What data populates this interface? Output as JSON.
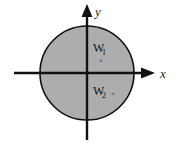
{
  "figure": {
    "type": "coordinate-plane-diagram",
    "background_color": "#ffffff",
    "axes": {
      "x_label": "x",
      "y_label": "y",
      "axis_color": "#111111",
      "origin": {
        "x": 87,
        "y": 73
      }
    },
    "shapes": [
      {
        "name": "shaded-disk",
        "kind": "circle",
        "center_x": 87,
        "center_y": 73,
        "radius": 47,
        "fill_color": "#adadad",
        "stroke_color": "#111111"
      }
    ],
    "points": [
      {
        "name": "point-w1",
        "label": "W",
        "subscript": "1",
        "marker": "×",
        "quadrant": "I",
        "label_x": 101,
        "label_y": 52,
        "marker_x": 104,
        "marker_y": 60
      },
      {
        "name": "point-w2",
        "label": "W",
        "subscript": "2",
        "marker": "×",
        "quadrant": "IV",
        "label_x": 101,
        "label_y": 95,
        "marker_x": 114,
        "marker_y": 95
      }
    ]
  }
}
